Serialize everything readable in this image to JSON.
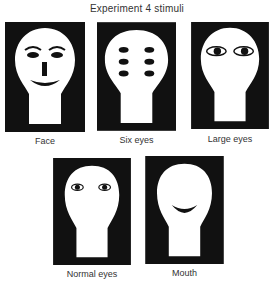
{
  "title": "Experiment 4 stimuli",
  "colors": {
    "background": "#ffffff",
    "panel": "#111111",
    "head": "#ffffff",
    "feature": "#111111"
  },
  "stimuli": [
    {
      "id": "face",
      "label": "Face",
      "features": [
        "eyebrows",
        "two eyes",
        "nose",
        "mouth"
      ]
    },
    {
      "id": "six-eyes",
      "label": "Six eyes",
      "features": [
        "six eyes in 3 rows of 2"
      ]
    },
    {
      "id": "large-eyes",
      "label": "Large eyes",
      "features": [
        "two large eyes"
      ]
    },
    {
      "id": "normal-eyes",
      "label": "Normal eyes",
      "features": [
        "two normal eyes"
      ]
    },
    {
      "id": "mouth",
      "label": "Mouth",
      "features": [
        "mouth"
      ]
    }
  ]
}
